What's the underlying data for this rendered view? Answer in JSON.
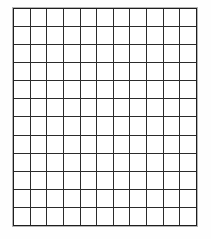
{
  "page": {
    "background_color": "#fdfdfd"
  },
  "chart_data": {
    "type": "table",
    "title": "",
    "subtitle": "",
    "xlabel": "",
    "ylabel": "",
    "columns": 11,
    "rows": 12,
    "grid": true,
    "legend": "none",
    "cell_values": [
      [
        "",
        "",
        "",
        "",
        "",
        "",
        "",
        "",
        "",
        "",
        ""
      ],
      [
        "",
        "",
        "",
        "",
        "",
        "",
        "",
        "",
        "",
        "",
        ""
      ],
      [
        "",
        "",
        "",
        "",
        "",
        "",
        "",
        "",
        "",
        "",
        ""
      ],
      [
        "",
        "",
        "",
        "",
        "",
        "",
        "",
        "",
        "",
        "",
        ""
      ],
      [
        "",
        "",
        "",
        "",
        "",
        "",
        "",
        "",
        "",
        "",
        ""
      ],
      [
        "",
        "",
        "",
        "",
        "",
        "",
        "",
        "",
        "",
        "",
        ""
      ],
      [
        "",
        "",
        "",
        "",
        "",
        "",
        "",
        "",
        "",
        "",
        ""
      ],
      [
        "",
        "",
        "",
        "",
        "",
        "",
        "",
        "",
        "",
        "",
        ""
      ],
      [
        "",
        "",
        "",
        "",
        "",
        "",
        "",
        "",
        "",
        "",
        ""
      ],
      [
        "",
        "",
        "",
        "",
        "",
        "",
        "",
        "",
        "",
        "",
        ""
      ],
      [
        "",
        "",
        "",
        "",
        "",
        "",
        "",
        "",
        "",
        "",
        ""
      ],
      [
        "",
        "",
        "",
        "",
        "",
        "",
        "",
        "",
        "",
        "",
        ""
      ]
    ],
    "colors": {
      "line": "#2b2b2b",
      "frame": "#1e1e1e",
      "cell_fill": "#ffffff",
      "page": "#fdfdfd"
    }
  }
}
